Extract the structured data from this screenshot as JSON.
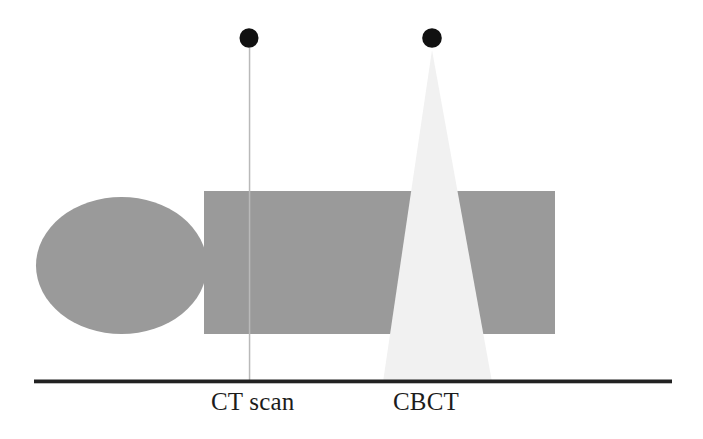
{
  "figure": {
    "background_color": "#ffffff",
    "width": 703,
    "height": 439,
    "labels": {
      "ct_scan": "CT scan",
      "cbct": "CBCT"
    },
    "colors": {
      "phantom_gray": "#9a9a9a",
      "beam_light": "#f1f1f1",
      "source_black": "#111111",
      "baseline_black": "#222222",
      "fan_line_gray": "#b9b9b9"
    },
    "elements": {
      "head_ellipse": {
        "name": "patient-head-ellipse",
        "cx": 121.5,
        "cy": 265.5,
        "rx": 85.5,
        "ry": 68.5,
        "fill": "#9a9a9a"
      },
      "body_rectangle": {
        "name": "patient-body-rectangle",
        "x": 204,
        "y": 191,
        "width": 351,
        "height": 143,
        "fill": "#9a9a9a"
      },
      "baseline": {
        "name": "detector-baseline",
        "x1": 34,
        "x2": 672,
        "y": 381,
        "thickness": 4,
        "stroke": "#222222"
      },
      "ct_source": {
        "name": "ct-xray-source-dot",
        "cx": 249,
        "cy": 38,
        "r": 9.5,
        "fill": "#111111"
      },
      "ct_beam": {
        "name": "ct-fan-beam-line",
        "x": 249.5,
        "y_top": 48,
        "y_bottom": 381,
        "thickness": 1.4,
        "stroke": "#b9b9b9"
      },
      "cbct_source": {
        "name": "cbct-xray-source-dot",
        "cx": 432,
        "cy": 38,
        "r": 9.5,
        "fill": "#111111"
      },
      "cbct_beam": {
        "name": "cbct-cone-beam",
        "apex_x": 432,
        "apex_y": 50,
        "base_left_x": 383,
        "base_right_x": 492,
        "base_y": 382,
        "fill": "#f1f1f1"
      }
    }
  }
}
